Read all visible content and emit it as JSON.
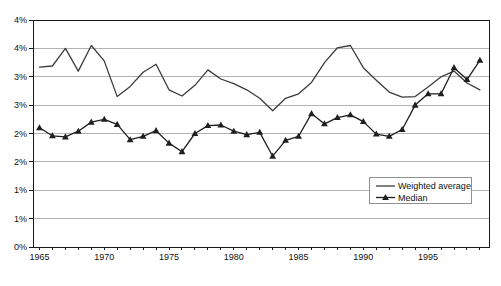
{
  "figure": {
    "background": "#ffffff"
  },
  "chart_data": {
    "type": "line",
    "title": "",
    "xlabel": "",
    "ylabel": "",
    "grid": true,
    "ylim": [
      0,
      4
    ],
    "x_range": [
      1964.5,
      1999.7
    ],
    "x": [
      1965,
      1966,
      1967,
      1968,
      1969,
      1970,
      1971,
      1972,
      1973,
      1974,
      1975,
      1976,
      1977,
      1978,
      1979,
      1980,
      1981,
      1982,
      1983,
      1984,
      1985,
      1986,
      1987,
      1988,
      1989,
      1990,
      1991,
      1992,
      1993,
      1994,
      1995,
      1996,
      1997,
      1998,
      1999
    ],
    "series": [
      {
        "name": "Weighted average",
        "marker": "none",
        "color": "#3c3c3c",
        "values": [
          3.17,
          3.19,
          3.5,
          3.1,
          3.55,
          3.28,
          2.65,
          2.83,
          3.08,
          3.22,
          2.77,
          2.66,
          2.85,
          3.12,
          2.96,
          2.88,
          2.77,
          2.62,
          2.4,
          2.62,
          2.7,
          2.9,
          3.25,
          3.51,
          3.55,
          3.16,
          2.94,
          2.73,
          2.64,
          2.65,
          2.82,
          3.0,
          3.1,
          2.89,
          2.77
        ]
      },
      {
        "name": "Median",
        "marker": "triangle",
        "color": "#1f1f1f",
        "values": [
          2.1,
          1.96,
          1.94,
          2.04,
          2.2,
          2.25,
          2.16,
          1.89,
          1.95,
          2.05,
          1.83,
          1.68,
          2.0,
          2.14,
          2.15,
          2.04,
          1.98,
          2.02,
          1.6,
          1.88,
          1.95,
          2.35,
          2.17,
          2.28,
          2.33,
          2.21,
          1.99,
          1.95,
          2.07,
          2.5,
          2.7,
          2.7,
          3.16,
          2.95,
          3.29
        ]
      }
    ],
    "yticks": [
      {
        "value": 4.0,
        "label": "4%"
      },
      {
        "value": 3.5,
        "label": "4%"
      },
      {
        "value": 3.0,
        "label": "3%"
      },
      {
        "value": 2.5,
        "label": "3%"
      },
      {
        "value": 2.0,
        "label": "2%"
      },
      {
        "value": 1.5,
        "label": "2%"
      },
      {
        "value": 1.0,
        "label": "1%"
      },
      {
        "value": 0.5,
        "label": "1%"
      },
      {
        "value": 0.0,
        "label": "0%"
      }
    ],
    "xticks_labeled": [
      1965,
      1970,
      1975,
      1980,
      1985,
      1990,
      1995
    ],
    "legend_position": "middle-right",
    "legend_entries": [
      "Weighted average",
      "Median"
    ]
  },
  "colors": {
    "background": "#ffffff",
    "axis": "#1a1a1a",
    "grid": "#b3b3b3",
    "text": "#111111",
    "legend_border": "#909090"
  }
}
